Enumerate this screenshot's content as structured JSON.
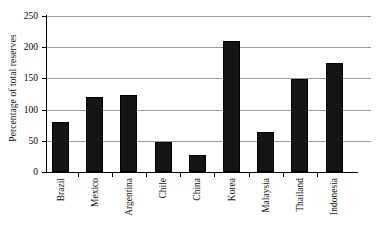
{
  "chart_data": {
    "type": "bar",
    "title": "",
    "xlabel": "",
    "ylabel": "Percentage of total reserves",
    "ylim": [
      0,
      250
    ],
    "yticks": [
      0,
      50,
      100,
      150,
      200,
      250
    ],
    "grid": true,
    "legend": "none",
    "bar_color": "#151515",
    "gridline_color": "#9a9a9a",
    "axis_color": "#000000",
    "categories": [
      "Brazil",
      "Mexico",
      "Argentina",
      "Chile",
      "China",
      "Korea",
      "Malaysia",
      "Thailand",
      "Indonesia"
    ],
    "values": [
      80,
      120,
      123,
      48,
      28,
      210,
      64,
      149,
      175
    ]
  },
  "axis": {
    "y_title": "Percentage of total reserves",
    "y_tick_labels": [
      "250",
      "200",
      "150",
      "100",
      "50",
      "0"
    ]
  }
}
